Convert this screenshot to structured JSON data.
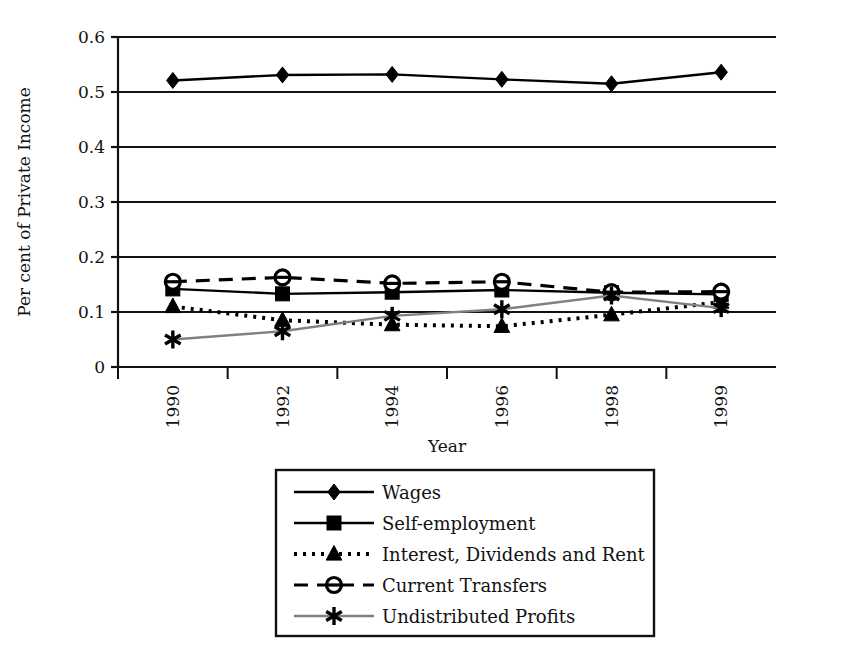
{
  "chart_data": {
    "type": "line",
    "title": "",
    "xlabel": "Year",
    "ylabel": "Per cent of Private Income",
    "categories": [
      "1990",
      "1992",
      "1994",
      "1996",
      "1998",
      "1999"
    ],
    "ylim": [
      0,
      0.6
    ],
    "ytick_labels": [
      "0.6",
      "0.5",
      "0.4",
      "0.3",
      "0.2",
      "0.1",
      "0"
    ],
    "ytick_values": [
      0.6,
      0.5,
      0.4,
      0.3,
      0.2,
      0.1,
      0
    ],
    "grid": "horizontal",
    "legend_position": "bottom",
    "series": [
      {
        "name": "Wages",
        "marker": "diamond",
        "line_style": "solid",
        "color": "#000000",
        "values": [
          0.521,
          0.531,
          0.532,
          0.523,
          0.515,
          0.536
        ]
      },
      {
        "name": "Self-employment",
        "marker": "square",
        "line_style": "solid",
        "color": "#000000",
        "values": [
          0.142,
          0.133,
          0.136,
          0.14,
          0.135,
          0.132
        ]
      },
      {
        "name": "Interest, Dividends and Rent",
        "marker": "triangle",
        "line_style": "dotted",
        "color": "#000000",
        "values": [
          0.11,
          0.085,
          0.077,
          0.074,
          0.095,
          0.118
        ]
      },
      {
        "name": "Current Transfers",
        "marker": "circle-open",
        "line_style": "dashed",
        "color": "#000000",
        "values": [
          0.155,
          0.163,
          0.152,
          0.155,
          0.136,
          0.137
        ]
      },
      {
        "name": "Undistributed Profits",
        "marker": "asterisk",
        "line_style": "solid-gray",
        "color": "#808080",
        "values": [
          0.05,
          0.065,
          0.093,
          0.105,
          0.13,
          0.107
        ]
      }
    ]
  },
  "axes": {
    "y_title": "Per cent of Private Income",
    "x_title": "Year"
  },
  "legend": {
    "items": [
      {
        "label": "Wages"
      },
      {
        "label": "Self-employment"
      },
      {
        "label": "Interest, Dividends and Rent"
      },
      {
        "label": "Current Transfers"
      },
      {
        "label": "Undistributed Profits"
      }
    ]
  }
}
